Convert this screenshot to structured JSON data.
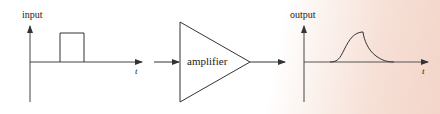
{
  "diagram": {
    "type": "signal-flow",
    "input_graph": {
      "y_label": "input",
      "x_label": "t",
      "signal": "rectangular pulse"
    },
    "block": {
      "label": "amplifier",
      "shape": "triangle"
    },
    "output_graph": {
      "y_label": "output",
      "x_label": "t",
      "signal": "smoothed pulse with rounded rise and exponential decay"
    },
    "colors": {
      "line": "#333333",
      "background_right": "#f3d5c9"
    }
  }
}
